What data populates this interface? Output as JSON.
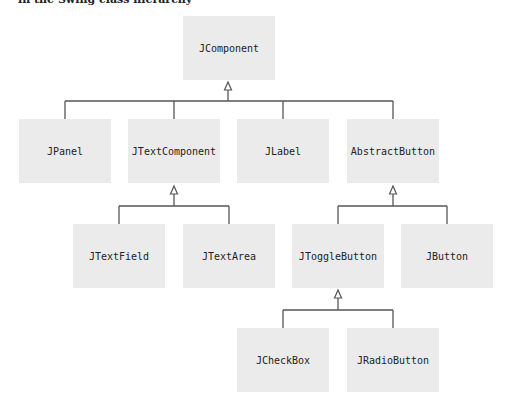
{
  "header": {
    "partial_text": "in the Swing class hierarchy"
  },
  "diagram": {
    "nodes": [
      {
        "id": "jcomponent",
        "label": "JComponent",
        "x": 183,
        "y": 16
      },
      {
        "id": "jpanel",
        "label": "JPanel",
        "x": 19,
        "y": 119
      },
      {
        "id": "jtextcomponent",
        "label": "JTextComponent",
        "x": 128,
        "y": 119
      },
      {
        "id": "jlabel",
        "label": "JLabel",
        "x": 237,
        "y": 119
      },
      {
        "id": "abstractbutton",
        "label": "AbstractButton",
        "x": 347,
        "y": 119
      },
      {
        "id": "jtextfield",
        "label": "JTextField",
        "x": 73,
        "y": 224
      },
      {
        "id": "jtextarea",
        "label": "JTextArea",
        "x": 183,
        "y": 224
      },
      {
        "id": "jtogglebutton",
        "label": "JToggleButton",
        "x": 292,
        "y": 224
      },
      {
        "id": "jbutton",
        "label": "JButton",
        "x": 401,
        "y": 224
      },
      {
        "id": "jcheckbox",
        "label": "JCheckBox",
        "x": 237,
        "y": 328
      },
      {
        "id": "jradiobutton",
        "label": "JRadioButton",
        "x": 347,
        "y": 328
      }
    ],
    "edges": [
      {
        "parent": "JComponent",
        "children": [
          "JPanel",
          "JTextComponent",
          "JLabel",
          "AbstractButton"
        ]
      },
      {
        "parent": "JTextComponent",
        "children": [
          "JTextField",
          "JTextArea"
        ]
      },
      {
        "parent": "AbstractButton",
        "children": [
          "JToggleButton",
          "JButton"
        ]
      },
      {
        "parent": "JToggleButton",
        "children": [
          "JCheckBox",
          "JRadioButton"
        ]
      }
    ],
    "colors": {
      "node_fill": "#ebebeb",
      "line": "#555555",
      "text": "#222222"
    }
  }
}
